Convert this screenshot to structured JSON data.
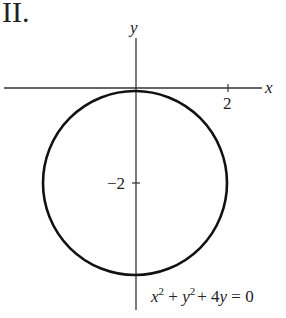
{
  "figure": {
    "label": "II.",
    "x_axis_label": "x",
    "y_axis_label": "y",
    "x_tick_label": "2",
    "y_tick_label": "−2",
    "equation": {
      "x": "x",
      "exp1": "2",
      "plus1": " + ",
      "y": "y",
      "exp2": "2",
      "rest": "+ 4",
      "y2": "y",
      "eq": " = 0"
    }
  },
  "diagram": {
    "shape": "circle",
    "center": [
      0,
      -2
    ],
    "radius": 2,
    "equation_text": "x^2 + y^2 + 4y = 0",
    "colors": {
      "stroke": "#111111",
      "axis": "#333333"
    }
  }
}
